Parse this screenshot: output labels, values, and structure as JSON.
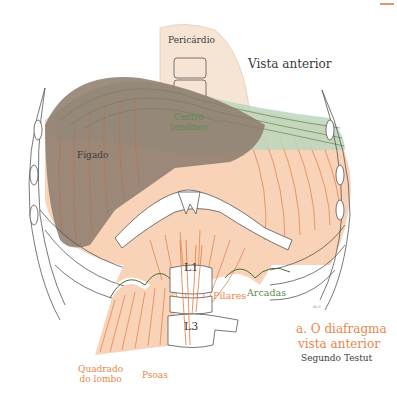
{
  "figure": {
    "caption_title": "a. O diafragma",
    "caption_subtitle": "vista anterior",
    "caption_source": "Segundo Testut",
    "view_label": "Vista anterior",
    "signature": "Dr.C"
  },
  "labels": {
    "pericardio": "Pericárdio",
    "centro_tendineo_line1": "Centro",
    "centro_tendineo_line2": "tendíneo",
    "figado": "Fígado",
    "l1": "L1",
    "l3": "L3",
    "pilares": "Pilares",
    "arcadas": "Arcadas",
    "quadrado_line1": "Quadrado",
    "quadrado_line2": "do lombo",
    "psoas": "Psoas"
  },
  "colors": {
    "muscle": "#f8d3b8",
    "muscle_fiber": "#e07a3c",
    "liver": "#8c7a6c",
    "tendon": "#bcd6bc",
    "tendon_line": "#5d8a4e",
    "pericardium": "#f6e4d4",
    "outline": "#555555",
    "label_orange": "#e8874a",
    "label_green": "#5d8a4e"
  }
}
